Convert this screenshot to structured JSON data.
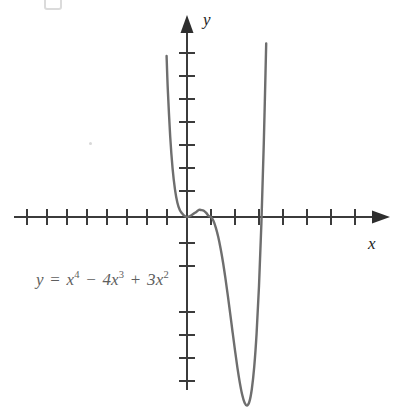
{
  "figure": {
    "background_color": "#ffffff",
    "axis_color": "#3b3b3b",
    "curve_color": "#6e6e6e",
    "label_color": "#1d1d1d",
    "equation_color": "#5e5e5e",
    "x_axis_label": "x",
    "y_axis_label": "y",
    "equation": {
      "full_text": "y = x⁴ − 4x³ + 3x²",
      "lhs": "y",
      "equals": "=",
      "term1_base": "x",
      "term1_exp": "4",
      "minus": "−",
      "term2_coef": "4x",
      "term2_exp": "3",
      "plus": "+",
      "term3_coef": "3x",
      "term3_exp": "2"
    }
  },
  "chart_data": {
    "type": "line",
    "title": "",
    "subtitle": "",
    "xlabel": "x",
    "ylabel": "y",
    "annotations": [
      "y = x⁴ − 4x³ + 3x²"
    ],
    "grid": false,
    "legend": null,
    "xlim": [
      -8,
      8
    ],
    "ylim": [
      -9,
      8
    ],
    "x_tick_count_left_of_origin": 8,
    "x_tick_count_right_of_origin": 7,
    "y_tick_count_above_origin": 7,
    "y_tick_count_below_origin": 6,
    "x_ticks": [
      -8,
      -7,
      -6,
      -5,
      -4,
      -3,
      -2,
      -1,
      1,
      2,
      3,
      4,
      5,
      6,
      7
    ],
    "y_ticks": [
      -9,
      -8,
      -7,
      -6,
      -5,
      -4,
      -3,
      -2,
      -1,
      1,
      2,
      3,
      4,
      5,
      6,
      7
    ],
    "x_tick_labels": [],
    "y_tick_labels": [],
    "series": [
      {
        "name": "y = x⁴ − 4x³ + 3x²",
        "color": "#6e6e6e",
        "equation": "y = x^4 - 4x^3 + 3x^2",
        "x": [
          -0.85,
          -0.8,
          -0.7,
          -0.6,
          -0.5,
          -0.4,
          -0.3,
          -0.2,
          -0.1,
          0.0,
          0.1,
          0.2,
          0.3,
          0.4,
          0.5,
          0.6,
          0.7,
          0.8,
          0.9,
          1.0,
          1.1,
          1.2,
          1.3,
          1.4,
          1.5,
          1.6,
          1.7,
          1.8,
          1.9,
          2.0,
          2.1,
          2.2,
          2.3,
          2.4,
          2.5,
          2.6,
          2.7,
          2.8,
          2.9,
          3.0,
          3.1,
          3.2,
          3.3,
          3.4,
          3.5
        ],
        "y": [
          7.0,
          5.55,
          3.5,
          2.1,
          1.19,
          0.62,
          0.3,
          0.15,
          0.04,
          0.0,
          0.03,
          0.09,
          0.16,
          0.23,
          0.31,
          0.3,
          0.27,
          0.18,
          0.05,
          0.0,
          -0.16,
          -0.46,
          -0.86,
          -1.37,
          -1.97,
          -2.66,
          -3.41,
          -4.2,
          -5.01,
          -5.8,
          -6.55,
          -7.2,
          -7.73,
          -8.08,
          -8.2,
          -8.03,
          -7.49,
          -6.53,
          -5.06,
          -3.0,
          -0.27,
          3.22,
          7.55,
          12.84,
          19.2
        ],
        "key_points": [
          {
            "label": "root at origin (double root)",
            "x": 0,
            "y": 0
          },
          {
            "label": "local maximum",
            "x": 0.45,
            "y": 0.32
          },
          {
            "label": "root",
            "x": 1,
            "y": 0
          },
          {
            "label": "local minimum",
            "x": 2.5,
            "y": -8.2
          },
          {
            "label": "root",
            "x": 3,
            "y": 0
          }
        ]
      }
    ]
  }
}
